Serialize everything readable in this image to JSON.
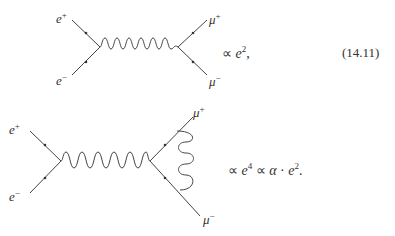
{
  "equation_1": {
    "number": "(14.11)",
    "particles": {
      "in_top": {
        "symbol": "e",
        "charge": "+"
      },
      "in_bottom": {
        "symbol": "e",
        "charge": "−"
      },
      "out_top": {
        "symbol": "μ",
        "charge": "+"
      },
      "out_bottom": {
        "symbol": "μ",
        "charge": "−"
      }
    },
    "proportional": "∝",
    "expr_var": "e",
    "expr_power": "2",
    "expr_tail": ","
  },
  "equation_2": {
    "particles": {
      "in_top": {
        "symbol": "e",
        "charge": "+"
      },
      "in_bottom": {
        "symbol": "e",
        "charge": "−"
      },
      "out_top": {
        "symbol": "μ",
        "charge": "+"
      },
      "out_bottom": {
        "symbol": "μ",
        "charge": "−"
      }
    },
    "proportional": "∝",
    "expr_var1": "e",
    "expr_power1": "4",
    "proportional2": "∝",
    "alpha": "α",
    "dot": "·",
    "expr_var2": "e",
    "expr_power2": "2",
    "expr_tail": "."
  },
  "colors": {
    "line": "#444444",
    "text": "#333333",
    "background": "#ffffff"
  }
}
